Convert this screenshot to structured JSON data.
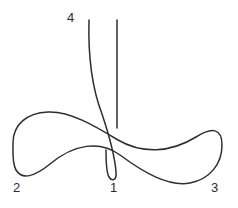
{
  "figure": {
    "width": 238,
    "height": 208,
    "background_color": "#ffffff",
    "stroke_color": "#2e2e33",
    "stroke_width": 1.5
  },
  "labels": {
    "branch_4": "4",
    "branch_2": "2",
    "branch_1": "1",
    "branch_3": "3"
  },
  "chart_data": {
    "type": "line",
    "title": "",
    "xlabel": "",
    "ylabel": "",
    "grid": false,
    "legend": "none",
    "axes_visible": false,
    "xlim": [
      0,
      238
    ],
    "ylim": [
      208,
      0
    ],
    "annotations": [
      {
        "text": "4",
        "x": 73,
        "y": 18,
        "role": "branch-label"
      },
      {
        "text": "2",
        "x": 17,
        "y": 188,
        "role": "branch-label"
      },
      {
        "text": "1",
        "x": 113,
        "y": 188,
        "role": "branch-label"
      },
      {
        "text": "3",
        "x": 215,
        "y": 188,
        "role": "branch-label"
      }
    ],
    "series": [
      {
        "name": "figure-eight-curve",
        "description": "Lemniscate-like double loop crossing near the centre; left lobe ends at label 2, right lobe ends at label 3",
        "closed": false,
        "points": [
          [
            13,
            143
          ],
          [
            16,
            124
          ],
          [
            27,
            115
          ],
          [
            48,
            112
          ],
          [
            70,
            120
          ],
          [
            92,
            132
          ],
          [
            110,
            141
          ],
          [
            130,
            148
          ],
          [
            152,
            151
          ],
          [
            175,
            145
          ],
          [
            200,
            133
          ],
          [
            215,
            124
          ],
          [
            222,
            140
          ],
          [
            218,
            163
          ],
          [
            205,
            178
          ],
          [
            188,
            183
          ],
          [
            168,
            177
          ],
          [
            145,
            164
          ],
          [
            122,
            152
          ],
          [
            100,
            147
          ],
          [
            74,
            152
          ],
          [
            48,
            168
          ],
          [
            30,
            176
          ],
          [
            17,
            170
          ],
          [
            13,
            152
          ],
          [
            13,
            143
          ]
        ]
      },
      {
        "name": "vertical-branch-1",
        "description": "Straight vertical stroke descending to the curve near label 1",
        "closed": false,
        "points": [
          [
            117,
            20
          ],
          [
            117,
            75
          ],
          [
            117,
            128
          ]
        ]
      },
      {
        "name": "descending-branch-4",
        "description": "Steeply descending arc from label 4 that bends right and forms the narrow cusp above label 1",
        "closed": false,
        "points": [
          [
            89,
            20
          ],
          [
            89,
            48
          ],
          [
            92,
            75
          ],
          [
            98,
            100
          ],
          [
            106,
            125
          ],
          [
            112,
            150
          ],
          [
            116,
            168
          ],
          [
            116,
            177
          ],
          [
            112,
            180
          ],
          [
            108,
            176
          ],
          [
            106,
            166
          ],
          [
            106,
            152
          ]
        ]
      }
    ]
  }
}
